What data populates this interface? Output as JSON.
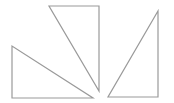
{
  "canvas": {
    "width": 174,
    "height": 103,
    "background": "#ffffff"
  },
  "style": {
    "stroke": "#9a9a9a",
    "stroke_width": 1.2,
    "fill": "none"
  },
  "shapes": [
    {
      "name": "left-triangle",
      "points": "12,46 12,98 93,98"
    },
    {
      "name": "middle-triangle",
      "points": "49,6 99,6 99,91"
    },
    {
      "name": "right-triangle",
      "points": "158,11 158,97 108,97"
    }
  ]
}
